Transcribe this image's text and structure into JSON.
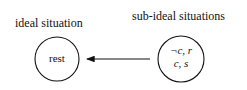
{
  "diagram": {
    "labels": {
      "ideal": "ideal situation",
      "sub_ideal": "sub-ideal situations"
    },
    "nodes": [
      {
        "id": "rest",
        "text": "rest"
      },
      {
        "id": "sub",
        "lines": [
          "¬c, r",
          "c, s"
        ]
      }
    ],
    "edges": [
      {
        "from": "sub",
        "to": "rest",
        "style": "arrow"
      }
    ]
  }
}
